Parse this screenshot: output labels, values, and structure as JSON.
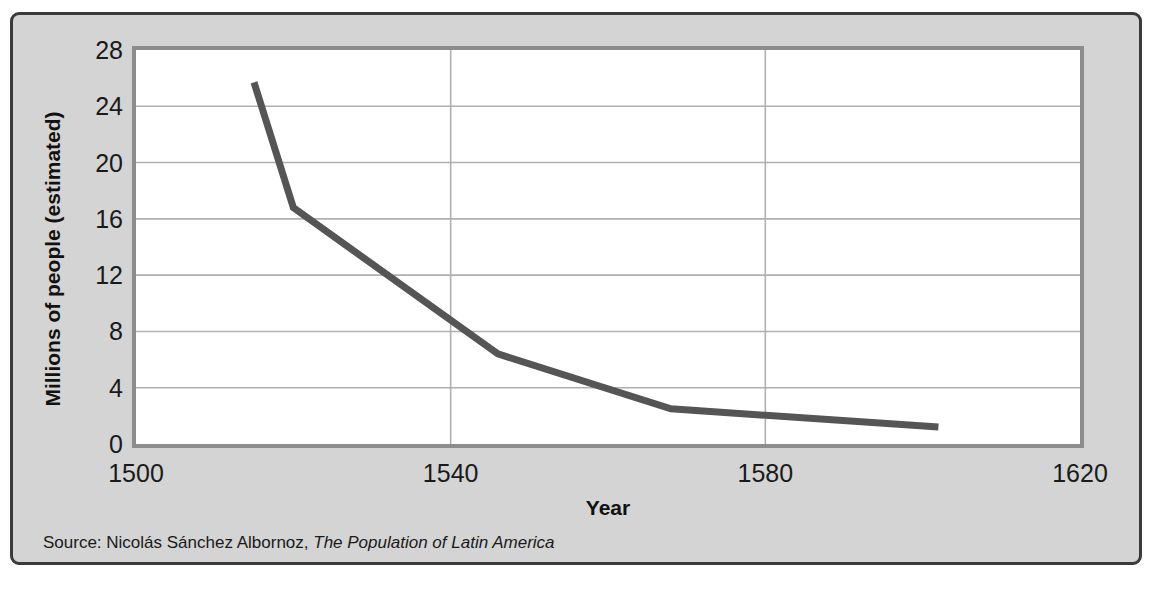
{
  "figure": {
    "background_color": "#d4d4d4",
    "border_color": "#3a3a3a",
    "plot_background_color": "#ffffff",
    "plot_border_color": "#8c8c8c",
    "gridline_color": "#b0b0b0",
    "line_color": "#555555"
  },
  "source": {
    "prefix": "Source: Nicolás Sánchez Albornoz, ",
    "title": "The Population of Latin America",
    "full": "Source: Nicolás Sánchez Albornoz, The Population of Latin America"
  },
  "chart_data": {
    "type": "line",
    "title": "",
    "xlabel": "Year",
    "ylabel": "Millions of people (estimated)",
    "xlim": [
      1500,
      1620
    ],
    "ylim": [
      0,
      28
    ],
    "xticks": [
      1500,
      1540,
      1580,
      1620
    ],
    "yticks": [
      0,
      4,
      8,
      12,
      16,
      20,
      24,
      28
    ],
    "grid": "both",
    "legend": "none",
    "series": [
      {
        "name": "Population of Latin America",
        "x": [
          1515,
          1520,
          1546,
          1568,
          1602
        ],
        "values": [
          25.7,
          16.8,
          6.4,
          2.5,
          1.2
        ]
      }
    ]
  }
}
